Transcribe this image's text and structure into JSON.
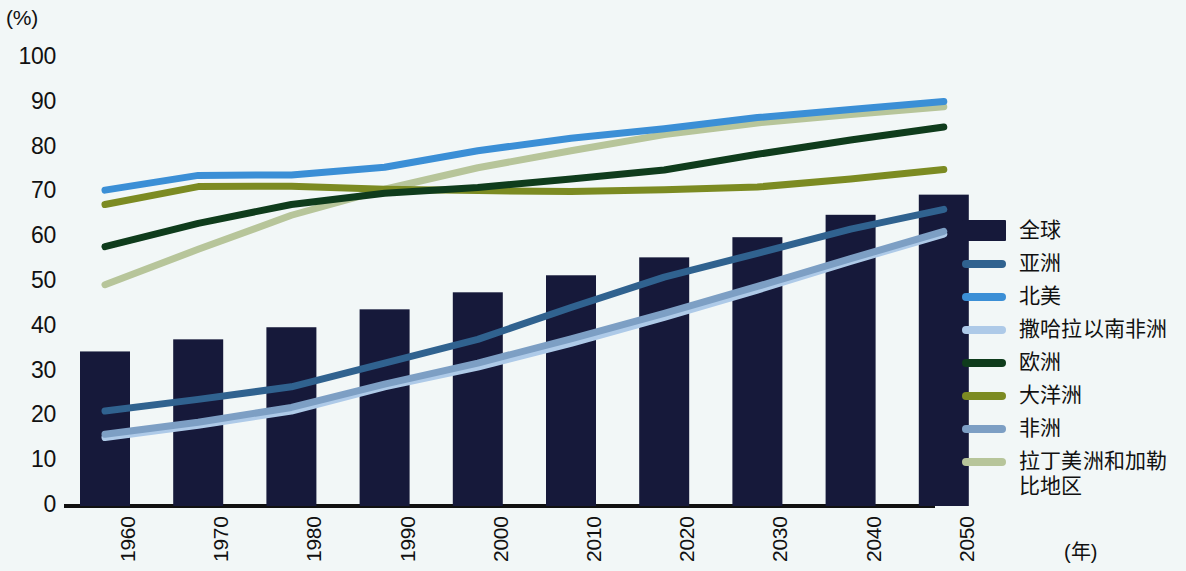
{
  "axis": {
    "y_unit": "(%)",
    "y_ticks": [
      "100",
      "90",
      "80",
      "70",
      "60",
      "50",
      "40",
      "30",
      "20",
      "10",
      "0"
    ],
    "x_unit": "(年)",
    "x_ticks": [
      "1960",
      "1970",
      "1980",
      "1990",
      "2000",
      "2010",
      "2020",
      "2030",
      "2040",
      "2050"
    ]
  },
  "legend": {
    "items": [
      {
        "label": "全球",
        "color": "#16193a",
        "style": "block"
      },
      {
        "label": "亚洲",
        "color": "#30628f",
        "style": "line"
      },
      {
        "label": "北美",
        "color": "#3b8fd6",
        "style": "line"
      },
      {
        "label": "撒哈拉以南非洲",
        "color": "#aecae8",
        "style": "line"
      },
      {
        "label": "欧洲",
        "color": "#0f3c1c",
        "style": "line"
      },
      {
        "label": "大洋洲",
        "color": "#7c8b22",
        "style": "line"
      },
      {
        "label": "非洲",
        "color": "#7d9fc4",
        "style": "line"
      },
      {
        "label": "拉丁美洲和加勒\n比地区",
        "color": "#b7c59a",
        "style": "line"
      }
    ]
  },
  "chart_data": {
    "type": "bar",
    "title": "",
    "xlabel": "(年)",
    "ylabel": "(%)",
    "ylim": [
      0,
      100
    ],
    "grid": false,
    "legend_position": "right",
    "categories": [
      "1960",
      "1970",
      "1980",
      "1990",
      "2000",
      "2010",
      "2020",
      "2030",
      "2040",
      "2050"
    ],
    "bar_series": {
      "name": "全球",
      "color": "#16193a",
      "values": [
        34.5,
        37.2,
        39.9,
        43.9,
        47.7,
        51.5,
        55.5,
        60.0,
        65.0,
        69.5
      ]
    },
    "series": [
      {
        "name": "亚洲",
        "color": "#30628f",
        "values": [
          21.2,
          23.8,
          26.6,
          31.9,
          37.2,
          44.3,
          51.1,
          56.4,
          61.8,
          66.2
        ]
      },
      {
        "name": "北美",
        "color": "#3b8fd6",
        "values": [
          70.5,
          73.8,
          73.9,
          75.6,
          79.3,
          82.1,
          84.2,
          86.7,
          88.5,
          90.3
        ]
      },
      {
        "name": "撒哈拉以南非洲",
        "color": "#aecae8",
        "values": [
          15.3,
          18.0,
          21.2,
          26.6,
          31.0,
          36.3,
          42.1,
          48.2,
          54.6,
          60.7
        ]
      },
      {
        "name": "欧洲",
        "color": "#0f3c1c",
        "values": [
          57.9,
          63.1,
          67.3,
          69.8,
          71.1,
          73.0,
          75.0,
          78.5,
          81.7,
          84.6
        ]
      },
      {
        "name": "大洋洲",
        "color": "#7c8b22",
        "values": [
          67.3,
          71.3,
          71.4,
          70.7,
          70.4,
          70.2,
          70.6,
          71.2,
          73.0,
          75.1
        ]
      },
      {
        "name": "非洲",
        "color": "#7d9fc4",
        "values": [
          16.0,
          18.7,
          22.0,
          27.2,
          31.9,
          37.3,
          43.0,
          49.0,
          55.2,
          61.3
        ]
      },
      {
        "name": "拉丁美洲和加勒比地区",
        "color": "#b7c59a",
        "values": [
          49.4,
          57.3,
          64.9,
          70.7,
          75.5,
          79.3,
          82.9,
          85.5,
          87.4,
          89.1
        ]
      }
    ]
  }
}
